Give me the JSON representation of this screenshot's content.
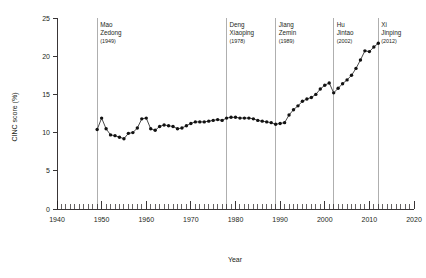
{
  "chart_data": {
    "type": "line",
    "title": "",
    "xlabel": "Year",
    "ylabel": "CINC score (%)",
    "xlim": [
      1940,
      2020
    ],
    "ylim": [
      0,
      25
    ],
    "xticks": [
      1940,
      1950,
      1960,
      1970,
      1980,
      1990,
      2000,
      2010,
      2020
    ],
    "xtick_labels": [
      "1940",
      "1950",
      "1960",
      "1970",
      "1980",
      "1990",
      "2000",
      "2010",
      "2020"
    ],
    "yticks": [
      0,
      5,
      10,
      15,
      20,
      25
    ],
    "ytick_labels": [
      "0",
      "5",
      "10",
      "15",
      "20",
      "25"
    ],
    "minor_xtick_step": 1,
    "grid": false,
    "legend": "none",
    "marker": "filled-circle",
    "series": [
      {
        "name": "CINC score",
        "color": "#121212",
        "x": [
          1949,
          1950,
          1951,
          1952,
          1953,
          1954,
          1955,
          1956,
          1957,
          1958,
          1959,
          1960,
          1961,
          1962,
          1963,
          1964,
          1965,
          1966,
          1967,
          1968,
          1969,
          1970,
          1971,
          1972,
          1973,
          1974,
          1975,
          1976,
          1977,
          1978,
          1979,
          1980,
          1981,
          1982,
          1983,
          1984,
          1985,
          1986,
          1987,
          1988,
          1989,
          1990,
          1991,
          1992,
          1993,
          1994,
          1995,
          1996,
          1997,
          1998,
          1999,
          2000,
          2001,
          2002,
          2003,
          2004,
          2005,
          2006,
          2007,
          2008,
          2009,
          2010,
          2011,
          2012
        ],
        "y": [
          10.4,
          11.9,
          10.5,
          9.7,
          9.6,
          9.4,
          9.2,
          9.9,
          10.0,
          10.6,
          11.8,
          11.9,
          10.5,
          10.3,
          10.8,
          11.0,
          10.9,
          10.8,
          10.5,
          10.6,
          10.9,
          11.2,
          11.4,
          11.4,
          11.4,
          11.5,
          11.6,
          11.7,
          11.6,
          11.9,
          12.0,
          12.0,
          11.9,
          11.9,
          11.9,
          11.8,
          11.6,
          11.5,
          11.4,
          11.3,
          11.1,
          11.2,
          11.3,
          12.3,
          13.0,
          13.5,
          14.1,
          14.4,
          14.6,
          15.0,
          15.7,
          16.2,
          16.5,
          15.2,
          15.8,
          16.4,
          16.9,
          17.5,
          18.4,
          19.5,
          20.7,
          20.6,
          21.2,
          21.7
        ]
      }
    ],
    "annotations": [
      {
        "id": "mao-zedong",
        "name_line1": "Mao",
        "name_line2": "Zedong",
        "year_label": "(1949)",
        "year": 1949
      },
      {
        "id": "deng-xiaoping",
        "name_line1": "Deng",
        "name_line2": "Xiaoping",
        "year_label": "(1978)",
        "year": 1978
      },
      {
        "id": "jiang-zemin",
        "name_line1": "Jiang",
        "name_line2": "Zemin",
        "year_label": "(1989)",
        "year": 1989
      },
      {
        "id": "hu-jintao",
        "name_line1": "Hu",
        "name_line2": "Jintao",
        "year_label": "(2002)",
        "year": 2002
      },
      {
        "id": "xi-jinping",
        "name_line1": "Xi",
        "name_line2": "Jinping",
        "year_label": "(2012)",
        "year": 2012
      }
    ],
    "colors": {
      "axis": "#231f20",
      "marker": "#121212",
      "leader_line": "#8d8d8d",
      "background": "#ffffff"
    }
  }
}
